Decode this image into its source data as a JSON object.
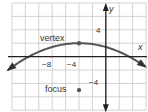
{
  "graph": {
    "x_axis_label": "x",
    "y_axis_label": "y",
    "x_ticks": [
      {
        "value": -8,
        "label": "−8"
      },
      {
        "value": -4,
        "label": "−4"
      }
    ],
    "y_ticks": [
      {
        "value": 4,
        "label": "4"
      },
      {
        "value": -4,
        "label": "−4"
      }
    ],
    "x_range": [
      -14,
      6
    ],
    "y_range": [
      -8,
      8
    ],
    "grid_step": 2,
    "points": {
      "vertex": {
        "label": "vertex",
        "x": -4,
        "y": 2
      },
      "focus": {
        "label": "focus",
        "x": -4,
        "y": -5
      }
    },
    "curve": {
      "type": "parabola",
      "opens": "down",
      "equation": "y = -(x+4)^2/28 + 2"
    },
    "colors": {
      "grid": "#c8c8c8",
      "axis": "#222222",
      "curve": "#555555",
      "point": "#555555"
    }
  }
}
